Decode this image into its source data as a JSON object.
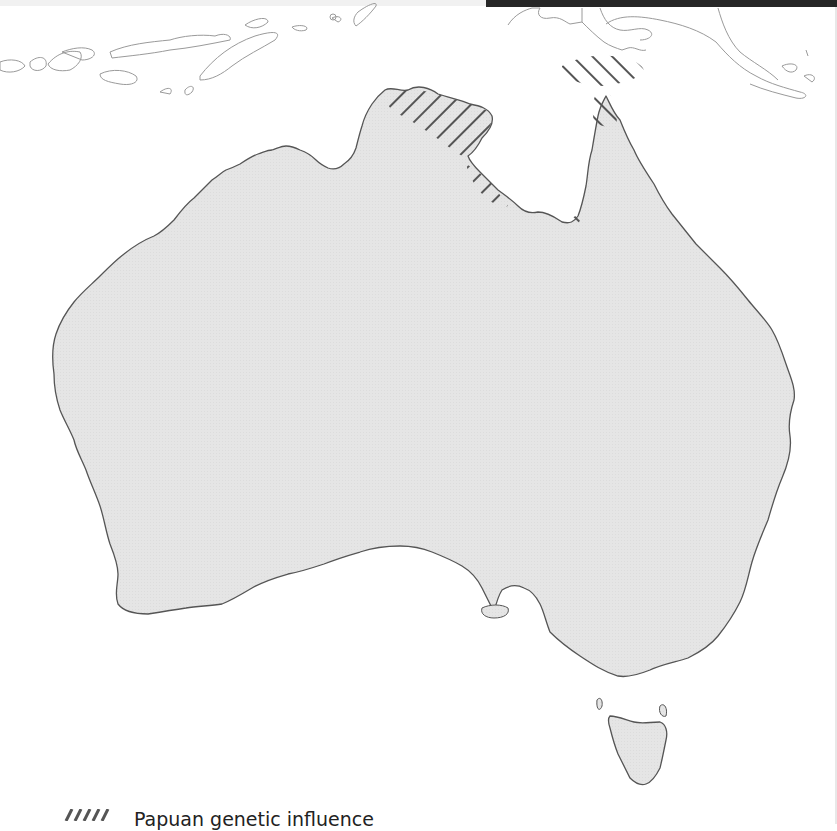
{
  "map": {
    "title": "",
    "regions": [
      {
        "name": "Australia (mainland)",
        "fill": "#e6e6e6",
        "stroke": "#555555"
      },
      {
        "name": "Tasmania",
        "fill": "#e6e6e6",
        "stroke": "#555555"
      },
      {
        "name": "Kangaroo Island",
        "fill": "#e6e6e6",
        "stroke": "#555555"
      },
      {
        "name": "Lesser Sunda Islands / Timor",
        "fill": "#ffffff",
        "stroke": "#9a9a9a"
      },
      {
        "name": "New Guinea",
        "fill": "#ffffff",
        "stroke": "#9a9a9a"
      }
    ],
    "hatched_areas": [
      {
        "name": "Top End / Arnhem Land",
        "pattern": "diagonal-backslash"
      },
      {
        "name": "Gulf of Carpentaria western coast",
        "pattern": "diagonal-backslash"
      },
      {
        "name": "Torres Strait",
        "pattern": "diagonal-slash"
      },
      {
        "name": "Cape York tip",
        "pattern": "diagonal-slash"
      }
    ],
    "colors": {
      "land": "#e6e6e6",
      "coast": "#555555",
      "neighbor_outline": "#9a9a9a",
      "hatch": "#555555",
      "background": "#ffffff",
      "top_bar": "#262626"
    }
  },
  "legend": {
    "items": [
      {
        "label": "Papuan genetic influence",
        "swatch": "hatched"
      }
    ]
  }
}
